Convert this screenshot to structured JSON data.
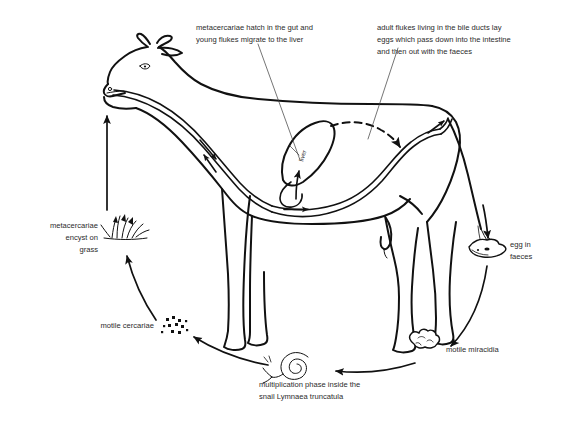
{
  "figure": {
    "background_color": "#ffffff",
    "ink_color": "#111111",
    "text_color": "#2b2b2b"
  },
  "annotations": {
    "gut_hatch": {
      "line1": "metacercariae hatch in the gut and",
      "line2": "young flukes migrate to the liver"
    },
    "bile_ducts": {
      "line1": "adult flukes living in the bile ducts lay",
      "line2": "eggs which pass down into the intestine",
      "line3": "and then out with the faeces"
    },
    "encyst": {
      "line1": "metacercariae",
      "line2": "encyst on",
      "line3": "grass"
    },
    "cercariae": {
      "line1": "motile cercariae"
    },
    "snail": {
      "line1": "multiplication phase inside the",
      "line2": "snail Lymnaea truncatula"
    },
    "miracidia": {
      "line1": "motile miracidia"
    },
    "egg": {
      "line1": "egg in",
      "line2": "faeces"
    },
    "organ": {
      "liver": "liver"
    }
  },
  "stages": [
    {
      "name": "grass-metacercariae",
      "icon": "grass-tuft-icon",
      "label": "metacercariae encyst on grass"
    },
    {
      "name": "cow-ingestion",
      "icon": "cow-icon",
      "label": "metacercariae hatch in the gut and young flukes migrate to the liver"
    },
    {
      "name": "adult-fluke-bile-duct",
      "icon": "liver-icon",
      "label": "adult flukes living in the bile ducts lay eggs which pass down into the intestine and then out with the faeces"
    },
    {
      "name": "egg-faeces",
      "icon": "faeces-blob-icon",
      "label": "egg in faeces"
    },
    {
      "name": "miracidia",
      "icon": "miracidia-blob-icon",
      "label": "motile miracidia"
    },
    {
      "name": "snail-multiplication",
      "icon": "snail-icon",
      "label": "multiplication phase inside the snail Lymnaea truncatula"
    },
    {
      "name": "cercariae",
      "icon": "cercariae-specks-icon",
      "label": "motile cercariae"
    }
  ]
}
